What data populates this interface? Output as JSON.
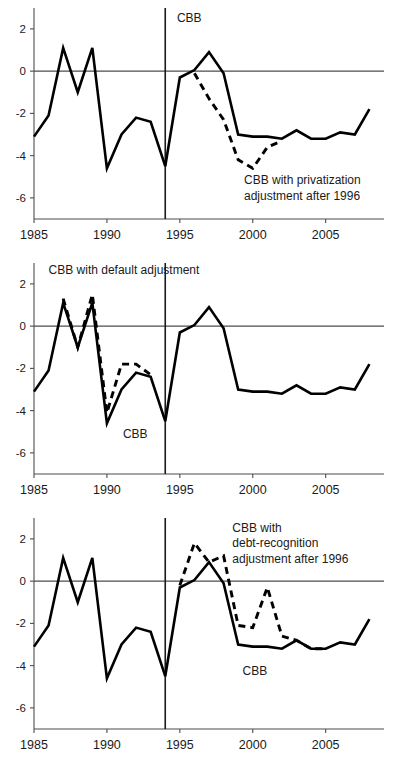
{
  "chart_data": [
    {
      "type": "line",
      "title": "",
      "panel_index": 0,
      "xlabel": "",
      "ylabel": "",
      "xlim": [
        1985,
        2009
      ],
      "ylim": [
        -7,
        2.8
      ],
      "xticks": [
        1985,
        1990,
        1995,
        2000,
        2005
      ],
      "yticks": [
        2,
        0,
        -2,
        -4,
        -6
      ],
      "xtick_labels": [
        "1985",
        "1990",
        "1995",
        "2000",
        "2005"
      ],
      "ytick_labels": [
        "2",
        "0",
        "-2",
        "-4",
        "-6"
      ],
      "grid": false,
      "zero_line": true,
      "vertical_marker_x": 1994,
      "legend_position": "inline-annotations",
      "annotations": [
        {
          "text": "CBB",
          "x": 1994.8,
          "y": 2.35,
          "align": "start"
        },
        {
          "text": "CBB with privatization",
          "x": 1999.4,
          "y": -5.35,
          "align": "start"
        },
        {
          "text": "adjustment after 1996",
          "x": 1999.4,
          "y": -6.1,
          "align": "start"
        }
      ],
      "series": [
        {
          "name": "CBB",
          "style": "solid",
          "x": [
            1985,
            1986,
            1987,
            1988,
            1989,
            1990,
            1991,
            1992,
            1993,
            1994,
            1995,
            1996,
            1997,
            1998,
            1999,
            2000,
            2001,
            2002,
            2003,
            2004,
            2005,
            2006,
            2007,
            2008
          ],
          "values": [
            -3.1,
            -2.1,
            1.1,
            -1.0,
            1.1,
            -4.6,
            -3.0,
            -2.2,
            -2.4,
            -4.5,
            -0.3,
            0.05,
            0.9,
            -0.1,
            -3.0,
            -3.1,
            -3.1,
            -3.2,
            -2.8,
            -3.2,
            -3.2,
            -2.9,
            -3.0,
            -1.8
          ]
        },
        {
          "name": "CBB with privatization adjustment after 1996",
          "style": "dashed",
          "x": [
            1996,
            1997,
            1998,
            1999,
            2000,
            2001,
            2002
          ],
          "values": [
            -0.1,
            -1.3,
            -2.3,
            -4.2,
            -4.6,
            -3.6,
            -3.3
          ]
        }
      ]
    },
    {
      "type": "line",
      "title": "",
      "panel_index": 1,
      "xlabel": "",
      "ylabel": "",
      "xlim": [
        1985,
        2009
      ],
      "ylim": [
        -7,
        2.8
      ],
      "xticks": [
        1985,
        1990,
        1995,
        2000,
        2005
      ],
      "yticks": [
        2,
        0,
        -2,
        -4,
        -6
      ],
      "xtick_labels": [
        "1985",
        "1990",
        "1995",
        "2000",
        "2005"
      ],
      "ytick_labels": [
        "2",
        "0",
        "-2",
        "-4",
        "-6"
      ],
      "grid": false,
      "zero_line": true,
      "vertical_marker_x": 1994,
      "legend_position": "inline-annotations",
      "annotations": [
        {
          "text": "CBB with default adjustment",
          "x": 1986.0,
          "y": 2.45,
          "align": "start"
        },
        {
          "text": "CBB",
          "x": 1991.1,
          "y": -5.3,
          "align": "start"
        }
      ],
      "series": [
        {
          "name": "CBB",
          "style": "solid",
          "x": [
            1985,
            1986,
            1987,
            1988,
            1989,
            1990,
            1991,
            1992,
            1993,
            1994,
            1995,
            1996,
            1997,
            1998,
            1999,
            2000,
            2001,
            2002,
            2003,
            2004,
            2005,
            2006,
            2007,
            2008
          ],
          "values": [
            -3.1,
            -2.1,
            1.1,
            -1.0,
            1.1,
            -4.6,
            -3.0,
            -2.2,
            -2.4,
            -4.5,
            -0.3,
            0.05,
            0.9,
            -0.1,
            -3.0,
            -3.1,
            -3.1,
            -3.2,
            -2.8,
            -3.2,
            -3.2,
            -2.9,
            -3.0,
            -1.8
          ]
        },
        {
          "name": "CBB with default adjustment",
          "style": "dashed",
          "x": [
            1987,
            1988,
            1989,
            1990,
            1991,
            1992,
            1993
          ],
          "values": [
            1.3,
            -1.0,
            1.5,
            -4.1,
            -1.8,
            -1.8,
            -2.3
          ]
        }
      ]
    },
    {
      "type": "line",
      "title": "",
      "panel_index": 2,
      "xlabel": "",
      "ylabel": "",
      "xlim": [
        1985,
        2009
      ],
      "ylim": [
        -7,
        2.8
      ],
      "xticks": [
        1985,
        1990,
        1995,
        2000,
        2005
      ],
      "yticks": [
        2,
        0,
        -2,
        -4,
        -6
      ],
      "xtick_labels": [
        "1985",
        "1990",
        "1995",
        "2000",
        "2005"
      ],
      "ytick_labels": [
        "2",
        "0",
        "-2",
        "-4",
        "-6"
      ],
      "grid": false,
      "zero_line": true,
      "vertical_marker_x": 1994,
      "legend_position": "inline-annotations",
      "annotations": [
        {
          "text": "CBB with",
          "x": 1998.6,
          "y": 2.35,
          "align": "start"
        },
        {
          "text": "debt-recognition",
          "x": 1998.6,
          "y": 1.6,
          "align": "start"
        },
        {
          "text": "adjustment after 1996",
          "x": 1998.6,
          "y": 0.85,
          "align": "start"
        },
        {
          "text": "CBB",
          "x": 1999.3,
          "y": -4.45,
          "align": "start"
        }
      ],
      "series": [
        {
          "name": "CBB",
          "style": "solid",
          "x": [
            1985,
            1986,
            1987,
            1988,
            1989,
            1990,
            1991,
            1992,
            1993,
            1994,
            1995,
            1996,
            1997,
            1998,
            1999,
            2000,
            2001,
            2002,
            2003,
            2004,
            2005,
            2006,
            2007,
            2008
          ],
          "values": [
            -3.1,
            -2.1,
            1.1,
            -1.0,
            1.1,
            -4.6,
            -3.0,
            -2.2,
            -2.4,
            -4.5,
            -0.3,
            0.05,
            0.9,
            -0.1,
            -3.0,
            -3.1,
            -3.1,
            -3.2,
            -2.8,
            -3.2,
            -3.2,
            -2.9,
            -3.0,
            -1.8
          ]
        },
        {
          "name": "CBB with debt-recognition adjustment after 1996",
          "style": "dashed",
          "x": [
            1995,
            1996,
            1997,
            1998,
            1999,
            2000,
            2001,
            2002,
            2003,
            2004,
            2005
          ],
          "values": [
            -0.2,
            1.8,
            0.9,
            1.2,
            -2.1,
            -2.2,
            -0.3,
            -2.6,
            -2.8,
            -3.2,
            -3.2
          ]
        }
      ]
    }
  ]
}
